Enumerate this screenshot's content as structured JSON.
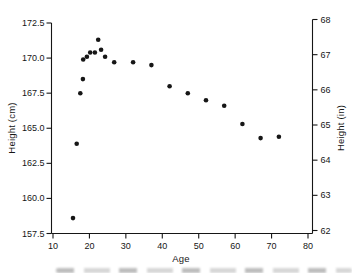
{
  "figure": {
    "background": "#ffffff",
    "ink_color": "#161616"
  },
  "chart_data": {
    "type": "scatter",
    "title": "",
    "xlabel": "Age",
    "ylabel_left": "Height (cm)",
    "ylabel_right": "Height (in)",
    "grid": false,
    "legend": null,
    "x_axis": {
      "min": 10,
      "max": 80,
      "tick_values": [
        10,
        20,
        30,
        40,
        50,
        60,
        70,
        80
      ],
      "tick_labels": [
        "10",
        "20",
        "30",
        "40",
        "50",
        "60",
        "70",
        "80"
      ]
    },
    "y_axis_left": {
      "min": 157.5,
      "max": 172.5,
      "tick_values": [
        157.5,
        160.0,
        162.5,
        165.0,
        167.5,
        170.0,
        172.5
      ],
      "tick_labels": [
        "157.5",
        "160.0",
        "162.5",
        "165.0",
        "167.5",
        "170.0",
        "172.5"
      ]
    },
    "y_axis_right": {
      "min": 62,
      "max": 68,
      "tick_values": [
        62,
        63,
        64,
        65,
        66,
        67,
        68
      ],
      "tick_labels": [
        "62",
        "63",
        "64",
        "65",
        "66",
        "67",
        "68"
      ]
    },
    "marker": {
      "shape": "circle",
      "diameter_px": 4.6,
      "color": "#161616"
    },
    "points": [
      {
        "age": 15.5,
        "height_cm": 158.6
      },
      {
        "age": 16.5,
        "height_cm": 163.9
      },
      {
        "age": 17.5,
        "height_cm": 167.5
      },
      {
        "age": 18.2,
        "height_cm": 168.5
      },
      {
        "age": 18.3,
        "height_cm": 169.9
      },
      {
        "age": 19.3,
        "height_cm": 170.1
      },
      {
        "age": 20.2,
        "height_cm": 170.4
      },
      {
        "age": 21.5,
        "height_cm": 170.4
      },
      {
        "age": 22.4,
        "height_cm": 171.3
      },
      {
        "age": 23.2,
        "height_cm": 170.6
      },
      {
        "age": 24.3,
        "height_cm": 170.1
      },
      {
        "age": 26.8,
        "height_cm": 169.7
      },
      {
        "age": 32.0,
        "height_cm": 169.7
      },
      {
        "age": 37.0,
        "height_cm": 169.5
      },
      {
        "age": 42.0,
        "height_cm": 168.0
      },
      {
        "age": 47.0,
        "height_cm": 167.5
      },
      {
        "age": 52.0,
        "height_cm": 167.0
      },
      {
        "age": 57.0,
        "height_cm": 166.6
      },
      {
        "age": 62.0,
        "height_cm": 165.3
      },
      {
        "age": 67.0,
        "height_cm": 164.3
      },
      {
        "age": 72.0,
        "height_cm": 164.4
      }
    ]
  }
}
